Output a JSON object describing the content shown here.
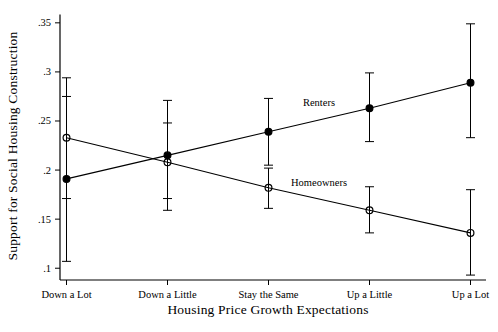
{
  "figure": {
    "background": "#ffffff",
    "foreground": "#000000"
  },
  "chart_data": {
    "type": "line",
    "title": "",
    "xlabel": "Housing Price Growth Expectations",
    "ylabel": "Support for Social Housing Construction",
    "categories": [
      "Down a Lot",
      "Down a Little",
      "Stay the Same",
      "Up a Little",
      "Up a Lot"
    ],
    "ylim": [
      0.088,
      0.3585
    ],
    "y_ticks": [
      0.1,
      0.15,
      0.2,
      0.25,
      0.3,
      0.35
    ],
    "y_tick_labels": [
      ".1",
      ".15",
      ".2",
      ".25",
      ".3",
      ".35"
    ],
    "grid": false,
    "legend_position": "inline-labels",
    "error_bars": "95% confidence intervals",
    "series": [
      {
        "name": "Renters",
        "marker": "filled-circle",
        "color": "#000000",
        "values": [
          0.191,
          0.215,
          0.239,
          0.263,
          0.289
        ],
        "ci_low": [
          0.107,
          0.159,
          0.205,
          0.229,
          0.233
        ],
        "ci_high": [
          0.275,
          0.271,
          0.273,
          0.299,
          0.349
        ],
        "label": {
          "text": "Renters",
          "x": 2.5,
          "y": 0.269
        }
      },
      {
        "name": "Homeowners",
        "marker": "hollow-circle",
        "color": "#000000",
        "values": [
          0.233,
          0.208,
          0.182,
          0.159,
          0.136
        ],
        "ci_low": [
          0.171,
          0.171,
          0.161,
          0.136,
          0.093
        ],
        "ci_high": [
          0.294,
          0.248,
          0.202,
          0.183,
          0.18
        ],
        "label": {
          "text": "Homeowners",
          "x": 2.5,
          "y": 0.187
        }
      }
    ]
  }
}
